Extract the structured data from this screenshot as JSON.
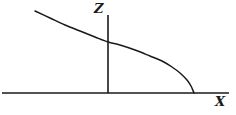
{
  "figure": {
    "background_color": "#ffffff",
    "line_color": "#1a1a1a",
    "width": 236,
    "height": 115
  },
  "axes": {
    "horizontal": {
      "name": "x-axis",
      "label": "X",
      "label_position": {
        "x": 215,
        "y": 95
      },
      "line": {
        "x1": 2,
        "y1": 93,
        "x2": 229,
        "y2": 93
      },
      "stroke_width": 1.6
    },
    "vertical": {
      "name": "z-axis",
      "label": "Z",
      "label_position": {
        "x": 94,
        "y": 2
      },
      "line": {
        "x1": 108,
        "y1": 15,
        "x2": 108,
        "y2": 93
      },
      "stroke_width": 1.6
    }
  },
  "chart_data": {
    "type": "line",
    "title": "",
    "xlabel": "X",
    "ylabel": "Z",
    "grid": false,
    "legend": null,
    "axis_origin": {
      "x": 108,
      "y": 93
    },
    "series": [
      {
        "name": "profile-curve",
        "stroke": "#1a1a1a",
        "stroke_width": 1.5,
        "points_px": [
          [
            35,
            11
          ],
          [
            50,
            18
          ],
          [
            65,
            25
          ],
          [
            80,
            31
          ],
          [
            95,
            37
          ],
          [
            108,
            42
          ],
          [
            120,
            45
          ],
          [
            135,
            50
          ],
          [
            150,
            56
          ],
          [
            162,
            61
          ],
          [
            172,
            67
          ],
          [
            180,
            73
          ],
          [
            187,
            80
          ],
          [
            191,
            86
          ],
          [
            194,
            93
          ]
        ]
      }
    ]
  },
  "labels": {
    "z": "Z",
    "x": "X"
  }
}
